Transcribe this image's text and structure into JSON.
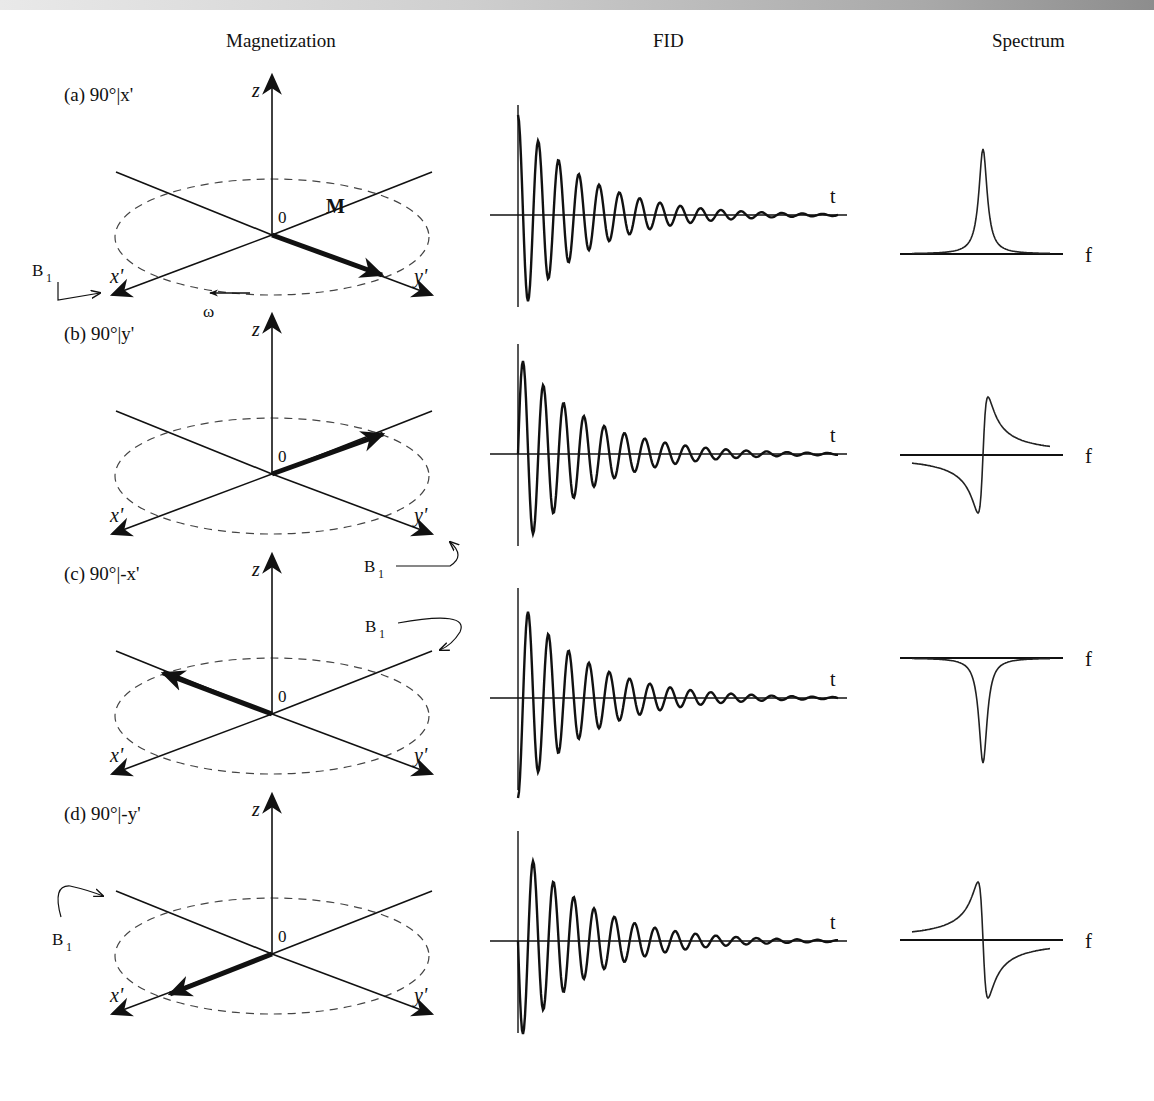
{
  "headers": {
    "magnetization": "Magnetization",
    "fid": "FID",
    "spectrum": "Spectrum"
  },
  "axis_labels": {
    "z": "z",
    "origin": "0",
    "x": "x'",
    "y": "y'",
    "t": "t",
    "f": "f",
    "B1": "B",
    "B1_sub": "1",
    "M": "M",
    "omega": "ω"
  },
  "rows": [
    {
      "label": "(a) 90°|x'",
      "pulse_axis": "x'",
      "magnetization_direction": "+y'",
      "spectrum_shape": "absorption (positive)"
    },
    {
      "label": "(b) 90°|y'",
      "pulse_axis": "y'",
      "magnetization_direction": "-x' (back)",
      "spectrum_shape": "dispersion (neg then pos)"
    },
    {
      "label": "(c) 90°|-x'",
      "pulse_axis": "-x'",
      "magnetization_direction": "-y' (back)",
      "spectrum_shape": "absorption (negative)"
    },
    {
      "label": "(d) 90°|-y'",
      "pulse_axis": "-y'",
      "magnetization_direction": "+x'",
      "spectrum_shape": "dispersion (pos then neg)"
    }
  ],
  "colors": {
    "ink": "#111111",
    "dash": "#555555",
    "topbar_left": "#e9e9e9",
    "topbar_right": "#8d8d8d"
  }
}
